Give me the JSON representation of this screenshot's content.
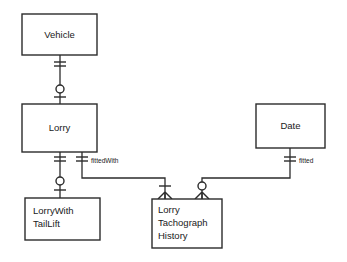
{
  "diagram": {
    "type": "entity-relationship-diagram",
    "notation": "crows-foot",
    "background_color": "#ffffff",
    "line_color": "#2b2b2b",
    "width": 347,
    "height": 262,
    "entities": [
      {
        "id": "vehicle",
        "name": "Vehicle",
        "lines": [
          "Vehicle"
        ],
        "x": 22,
        "y": 14,
        "w": 75,
        "h": 41
      },
      {
        "id": "lorry",
        "name": "Lorry",
        "lines": [
          "Lorry"
        ],
        "x": 22,
        "y": 104,
        "w": 75,
        "h": 48
      },
      {
        "id": "date",
        "name": "Date",
        "lines": [
          "Date"
        ],
        "x": 256,
        "y": 104,
        "w": 69,
        "h": 44
      },
      {
        "id": "lorry-with-tail-lift",
        "name": "LorryWith TailLift",
        "lines": [
          "LorryWith",
          "TailLift"
        ],
        "x": 25,
        "y": 198,
        "w": 75,
        "h": 42
      },
      {
        "id": "lorry-tachograph-history",
        "name": "Lorry Tachograph History",
        "lines": [
          "Lorry",
          "Tachograph",
          "History"
        ],
        "x": 152,
        "y": 199,
        "w": 70,
        "h": 49
      }
    ],
    "relationships": [
      {
        "id": "vehicle-lorry",
        "from": "vehicle",
        "to": "lorry",
        "label": "",
        "from_cardinality": "one-and-only-one",
        "to_cardinality": "zero-or-one"
      },
      {
        "id": "lorry-lorrywithtaillift",
        "from": "lorry",
        "to": "lorry-with-tail-lift",
        "label": "",
        "from_cardinality": "one-and-only-one",
        "to_cardinality": "zero-or-one"
      },
      {
        "id": "lorry-tachographhistory",
        "from": "lorry",
        "to": "lorry-tachograph-history",
        "label": "fittedWith",
        "from_cardinality": "one-and-only-one",
        "to_cardinality": "one-or-many"
      },
      {
        "id": "date-tachographhistory",
        "from": "date",
        "to": "lorry-tachograph-history",
        "label": "fitted",
        "from_cardinality": "one-and-only-one",
        "to_cardinality": "zero-or-many"
      }
    ],
    "labels": {
      "fitted_with": "fittedWith",
      "fitted": "fitted"
    }
  }
}
